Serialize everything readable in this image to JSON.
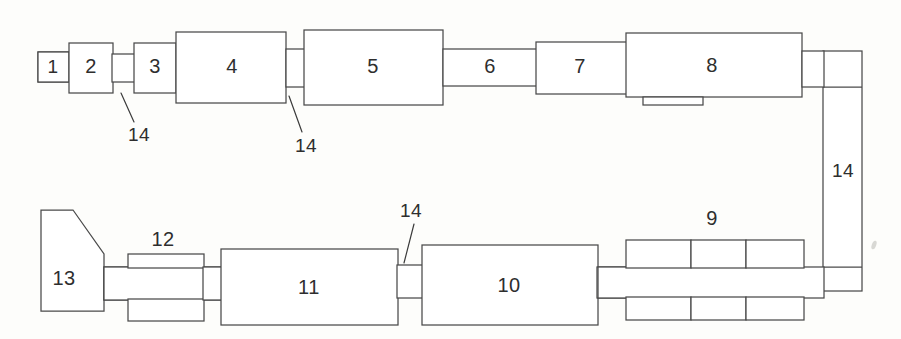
{
  "diagram": {
    "background_color": "#fdfdfb",
    "line_color": "#4a4a4a",
    "text_color": "#2e2e2e",
    "blocks": [
      {
        "id": "1",
        "label": "1",
        "cx": 53,
        "cy": 67,
        "shape": "rect",
        "x": 38,
        "y": 52,
        "w": 31,
        "h": 30
      },
      {
        "id": "2",
        "label": "2",
        "cx": 91,
        "cy": 67,
        "shape": "rect",
        "x": 69,
        "y": 43,
        "w": 44,
        "h": 50
      },
      {
        "id": "3",
        "label": "3",
        "cx": 155,
        "cy": 67,
        "shape": "rect",
        "x": 134,
        "y": 43,
        "w": 42,
        "h": 50
      },
      {
        "id": "4",
        "label": "4",
        "cx": 232,
        "cy": 67,
        "shape": "rect",
        "x": 179,
        "y": 32,
        "w": 107,
        "h": 71
      },
      {
        "id": "5",
        "label": "5",
        "cx": 373,
        "cy": 67,
        "shape": "rect",
        "x": 304,
        "y": 30,
        "w": 139,
        "h": 75
      },
      {
        "id": "6",
        "label": "6",
        "cx": 490,
        "cy": 67,
        "shape": "bar",
        "x": 443,
        "y": 49,
        "w": 92,
        "h": 37
      },
      {
        "id": "7",
        "label": "7",
        "cx": 580,
        "cy": 67,
        "shape": "rect",
        "x": 536,
        "y": 42,
        "w": 90,
        "h": 52
      },
      {
        "id": "8",
        "label": "8",
        "cx": 712,
        "cy": 67,
        "shape": "rect",
        "x": 626,
        "y": 33,
        "w": 176,
        "h": 64
      },
      {
        "id": "9",
        "label": "9",
        "cx": 712,
        "cy": 218,
        "shape": "segmented-rail"
      },
      {
        "id": "10",
        "label": "10",
        "cx": 509,
        "cy": 285,
        "shape": "rect",
        "x": 422,
        "y": 245,
        "w": 176,
        "h": 80
      },
      {
        "id": "11",
        "label": "11",
        "cx": 309,
        "cy": 287,
        "shape": "rect",
        "x": 221,
        "y": 249,
        "w": 177,
        "h": 76
      },
      {
        "id": "12",
        "label": "12",
        "cx": 163,
        "cy": 239,
        "shape": "collar-rail"
      },
      {
        "id": "13",
        "label": "13",
        "cx": 64,
        "cy": 278,
        "shape": "polygon"
      }
    ],
    "callouts": [
      {
        "id": "callout-14-a",
        "label": "14",
        "text_x": 139,
        "text_y": 134,
        "line": {
          "x1": 133,
          "y1": 120,
          "x2": 121,
          "y2": 93
        }
      },
      {
        "id": "callout-14-b",
        "label": "14",
        "text_x": 306,
        "text_y": 145,
        "line": {
          "x1": 300,
          "y1": 131,
          "x2": 289,
          "y2": 96
        }
      },
      {
        "id": "callout-14-c",
        "label": "14",
        "text_x": 843,
        "text_y": 170,
        "line": null
      },
      {
        "id": "callout-14-d",
        "label": "14",
        "text_x": 411,
        "text_y": 213,
        "line": {
          "x1": 411,
          "y1": 222,
          "x2": 404,
          "y2": 262
        }
      }
    ],
    "segmented_rail": {
      "name": "component-9",
      "upper_cells": [
        {
          "x": 626,
          "y": 240,
          "w": 65,
          "h": 28
        },
        {
          "x": 691,
          "y": 240,
          "w": 55,
          "h": 28
        },
        {
          "x": 746,
          "y": 240,
          "w": 58,
          "h": 28
        }
      ],
      "lower_cells": [
        {
          "x": 626,
          "y": 297,
          "w": 65,
          "h": 23
        },
        {
          "x": 691,
          "y": 297,
          "w": 55,
          "h": 23
        },
        {
          "x": 746,
          "y": 297,
          "w": 58,
          "h": 23
        }
      ],
      "center_bar": {
        "x": 598,
        "y": 267,
        "w": 226,
        "h": 31
      }
    },
    "collar_rail": {
      "name": "component-12",
      "upper_cell": {
        "x": 128,
        "y": 254,
        "w": 76,
        "h": 14
      },
      "lower_cell": {
        "x": 128,
        "y": 299,
        "w": 76,
        "h": 22
      },
      "center_bar": {
        "x": 104,
        "y": 267,
        "w": 118,
        "h": 33
      }
    },
    "polygon_13": {
      "name": "component-13",
      "points": "41,210 73,210 104,254 104,311 41,311"
    },
    "connectors": [
      {
        "name": "conn-2-to-3",
        "x": 113,
        "y": 54,
        "w": 21,
        "h": 28
      },
      {
        "name": "conn-4-to-5",
        "x": 286,
        "y": 49,
        "w": 18,
        "h": 38
      },
      {
        "name": "conn-5-to-6",
        "x": 443,
        "y": 49,
        "w": 93,
        "h": 37
      },
      {
        "name": "conn-8-to-right-a",
        "x": 802,
        "y": 51,
        "w": 22,
        "h": 36
      },
      {
        "name": "conn-tab-under-8",
        "x": 643,
        "y": 97,
        "w": 60,
        "h": 8
      },
      {
        "name": "right-return-rail",
        "x": 823,
        "y": 51,
        "w": 39,
        "h": 240
      },
      {
        "name": "conn-11-to-10",
        "x": 398,
        "y": 265,
        "w": 25,
        "h": 33
      },
      {
        "name": "conn-10-to-9",
        "x": 597,
        "y": 267,
        "w": 30,
        "h": 31
      },
      {
        "name": "conn-13-to-12",
        "x": 104,
        "y": 267,
        "w": 25,
        "h": 33
      },
      {
        "name": "conn-12-to-11",
        "x": 203,
        "y": 267,
        "w": 20,
        "h": 33
      }
    ]
  }
}
